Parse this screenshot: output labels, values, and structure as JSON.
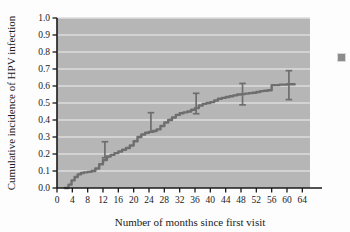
{
  "chart_data": {
    "type": "line",
    "title": "",
    "subtitle": "",
    "xlabel": "Number of months since first visit",
    "ylabel": "Cumulative incidence of HPV infection",
    "xlim": [
      0,
      66
    ],
    "ylim": [
      0.0,
      1.0
    ],
    "grid": "horizontal",
    "legend": "none",
    "xticks": [
      0,
      4,
      8,
      12,
      16,
      20,
      24,
      28,
      32,
      36,
      40,
      44,
      48,
      52,
      56,
      60,
      64
    ],
    "xtick_labels": [
      "0",
      "4",
      "8",
      "12",
      "16",
      "20",
      "24",
      "28",
      "32",
      "36",
      "40",
      "44",
      "48",
      "52",
      "56",
      "60",
      "64"
    ],
    "yticks": [
      0.0,
      0.1,
      0.2,
      0.3,
      0.4,
      0.5,
      0.6,
      0.7,
      0.8,
      0.9,
      1.0
    ],
    "ytick_labels": [
      "0.0",
      "0.1",
      "0.2",
      "0.3",
      "0.4",
      "0.5",
      "0.6",
      "0.7",
      "0.8",
      "0.9",
      "1.0"
    ],
    "series": [
      {
        "name": "Cumulative incidence of HPV infection",
        "style": "step",
        "color": "#6e6e6e",
        "x": [
          2.0,
          3.0,
          3.8,
          4.6,
          5.4,
          6.2,
          7.0,
          8.0,
          9.0,
          10.0,
          11.0,
          12.0,
          13.0,
          14.0,
          15.0,
          16.0,
          17.0,
          18.0,
          19.0,
          20.0,
          21.0,
          22.0,
          23.0,
          24.0,
          25.0,
          26.0,
          27.0,
          28.0,
          29.0,
          30.0,
          31.0,
          32.0,
          33.0,
          34.0,
          35.0,
          36.0,
          37.0,
          38.0,
          39.0,
          40.0,
          41.0,
          42.0,
          43.0,
          44.0,
          45.0,
          46.0,
          47.0,
          48.0,
          49.0,
          50.0,
          51.0,
          52.0,
          53.0,
          54.0,
          55.0,
          56.0,
          58.0,
          60.0,
          62.0
        ],
        "y": [
          0.0,
          0.02,
          0.045,
          0.065,
          0.08,
          0.088,
          0.092,
          0.095,
          0.1,
          0.115,
          0.14,
          0.165,
          0.185,
          0.195,
          0.205,
          0.215,
          0.225,
          0.235,
          0.25,
          0.275,
          0.3,
          0.315,
          0.325,
          0.33,
          0.335,
          0.345,
          0.365,
          0.385,
          0.4,
          0.415,
          0.43,
          0.44,
          0.445,
          0.45,
          0.46,
          0.47,
          0.485,
          0.495,
          0.5,
          0.505,
          0.515,
          0.525,
          0.53,
          0.535,
          0.54,
          0.545,
          0.55,
          0.552,
          0.555,
          0.558,
          0.56,
          0.565,
          0.57,
          0.572,
          0.575,
          0.605,
          0.608,
          0.61,
          0.61
        ]
      }
    ],
    "error_bars": [
      {
        "x": 12.5,
        "y": 0.225,
        "lower": 0.178,
        "upper": 0.272,
        "color": "#6e6e6e"
      },
      {
        "x": 24.5,
        "y": 0.385,
        "lower": 0.33,
        "upper": 0.443,
        "color": "#6e6e6e"
      },
      {
        "x": 36.3,
        "y": 0.498,
        "lower": 0.437,
        "upper": 0.557,
        "color": "#6e6e6e"
      },
      {
        "x": 48.4,
        "y": 0.553,
        "lower": 0.489,
        "upper": 0.615,
        "color": "#6e6e6e"
      },
      {
        "x": 60.5,
        "y": 0.607,
        "lower": 0.52,
        "upper": 0.69,
        "color": "#6e6e6e"
      }
    ],
    "colors": {
      "plot_background": "#b6b6b6",
      "gridline": "#dcdcdc",
      "axis": "#1a1a1a",
      "curve": "#6e6e6e",
      "page_background": "#fdfdfd",
      "marker": "#8c8c8c"
    },
    "annotations": [
      {
        "name": "corner-square-mark",
        "shape": "square",
        "color": "#8c8c8c"
      }
    ]
  }
}
